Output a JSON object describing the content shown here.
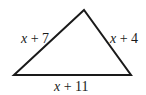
{
  "diagram": {
    "type": "triangle",
    "vertices": [
      [
        14,
        75
      ],
      [
        84,
        10
      ],
      [
        131,
        75
      ]
    ],
    "stroke_color": "#1a1a1a",
    "labels": {
      "left_side": {
        "var": "x",
        "rest": " + 7"
      },
      "right_side": {
        "var": "x",
        "rest": " + 4"
      },
      "bottom_side": {
        "var": "x",
        "rest": " + 11"
      }
    }
  }
}
